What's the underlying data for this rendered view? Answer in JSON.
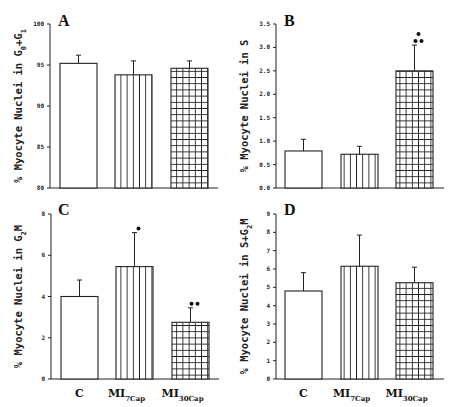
{
  "chart_data": [
    {
      "type": "bar",
      "panel": "A",
      "title": "A",
      "ylabel": "% Myocyte Nuclei in G0+G1",
      "categories": [
        "C",
        "MI7Cap",
        "MI30Cap"
      ],
      "values": [
        95.2,
        93.8,
        94.6
      ],
      "errors": [
        1.0,
        1.7,
        0.9
      ],
      "annotations": [
        "",
        "",
        ""
      ],
      "ylim": [
        80,
        100
      ],
      "yticks": [
        "80",
        "85",
        "90",
        "95",
        "100"
      ],
      "grid": false
    },
    {
      "type": "bar",
      "panel": "B",
      "title": "B",
      "ylabel": "% Myocyte Nuclei in S",
      "categories": [
        "C",
        "MI7Cap",
        "MI30Cap"
      ],
      "values": [
        0.79,
        0.72,
        2.5
      ],
      "errors": [
        0.25,
        0.17,
        0.55
      ],
      "annotations": [
        "",
        "",
        "*\n**"
      ],
      "ylim": [
        0,
        3.5
      ],
      "yticks": [
        "0.0",
        "0.5",
        "1.0",
        "1.5",
        "2.0",
        "2.5",
        "3.0",
        "3.5"
      ],
      "grid": false
    },
    {
      "type": "bar",
      "panel": "C",
      "title": "C",
      "ylabel": "% Myocyte Nuclei in G2M",
      "categories": [
        "C",
        "MI7Cap",
        "MI30Cap"
      ],
      "values": [
        4.0,
        5.45,
        2.75
      ],
      "errors": [
        0.8,
        1.65,
        0.7
      ],
      "annotations": [
        "",
        "*",
        "**"
      ],
      "ylim": [
        0,
        8
      ],
      "yticks": [
        "0",
        "2",
        "4",
        "6",
        "8"
      ],
      "grid": false
    },
    {
      "type": "bar",
      "panel": "D",
      "title": "D",
      "ylabel": "% Myocyte Nuclei in S+G2M",
      "categories": [
        "C",
        "MI7Cap",
        "MI30Cap"
      ],
      "values": [
        4.8,
        6.15,
        5.25
      ],
      "errors": [
        1.0,
        1.7,
        0.85
      ],
      "annotations": [
        "",
        "",
        ""
      ],
      "ylim": [
        0,
        9
      ],
      "yticks": [
        "0",
        "1",
        "2",
        "3",
        "4",
        "5",
        "6",
        "7",
        "8",
        "9"
      ],
      "grid": false
    }
  ],
  "xaxis": {
    "labels": [
      {
        "main": "C",
        "sub": ""
      },
      {
        "main": "MI",
        "sub": "7Cap"
      },
      {
        "main": "MI",
        "sub": "30Cap"
      }
    ]
  },
  "legend": {
    "fills": [
      "open",
      "vertical-lines",
      "grid-hatch"
    ]
  }
}
